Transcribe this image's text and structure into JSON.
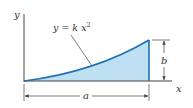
{
  "diagram": {
    "axes": {
      "x_label": "x",
      "y_label": "y"
    },
    "curve": {
      "equation_lhs": "y = k x",
      "equation_exponent": "2",
      "color": "#1f6fb5"
    },
    "region": {
      "fill": "#bfe0f3"
    },
    "dimensions": {
      "width_label": "a",
      "height_label": "b"
    },
    "colors": {
      "axis": "#444444",
      "curve": "#1f6fb5",
      "fill": "#bfe0f3",
      "dimension": "#444444"
    }
  }
}
